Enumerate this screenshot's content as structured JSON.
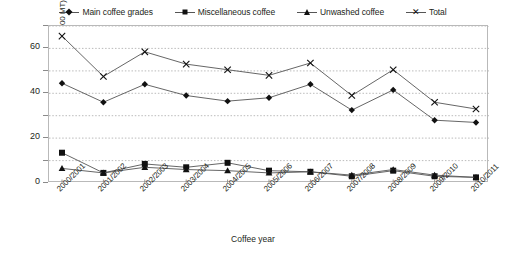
{
  "chart_data": {
    "type": "line",
    "title": "",
    "xlabel": "Coffee year",
    "ylabel": "Coffee auctioned (000 MT)",
    "categories": [
      "2000/2001",
      "2001/2002",
      "2002/2003",
      "2003/2004",
      "2004/2005",
      "2005/2006",
      "2006/2007",
      "2007/2008",
      "2008/2009",
      "2009/2010",
      "2010/2011"
    ],
    "ylim": [
      0,
      70
    ],
    "yticks": [
      0,
      20,
      40,
      60
    ],
    "ytick_labels": [
      "0",
      "20",
      "40",
      "60"
    ],
    "gridlines": [
      10,
      20,
      30,
      40,
      50,
      60,
      70
    ],
    "grid": true,
    "legend_position": "top",
    "series": [
      {
        "name": "Main coffee grades",
        "marker": "diamond",
        "values": [
          44.5,
          36.0,
          44.0,
          39.0,
          36.5,
          38.0,
          44.0,
          32.5,
          41.5,
          28.0,
          27.0
        ]
      },
      {
        "name": "Miscellaneous coffee",
        "marker": "square",
        "values": [
          13.5,
          4.5,
          8.5,
          7.0,
          9.0,
          5.5,
          5.0,
          3.0,
          5.5,
          3.0,
          2.5
        ]
      },
      {
        "name": "Unwashed coffee",
        "marker": "triangle",
        "values": [
          6.5,
          4.5,
          7.0,
          6.0,
          5.5,
          4.5,
          5.0,
          3.5,
          6.0,
          3.5,
          2.5
        ]
      },
      {
        "name": "Total",
        "marker": "cross",
        "values": [
          65.5,
          47.5,
          58.5,
          53.0,
          50.5,
          48.0,
          53.5,
          39.0,
          50.5,
          36.0,
          33.0
        ]
      }
    ]
  },
  "legend": {
    "items": [
      {
        "label": "Main coffee grades",
        "marker": "diamond-marker"
      },
      {
        "label": "Miscellaneous coffee",
        "marker": "square-marker"
      },
      {
        "label": "Unwashed coffee",
        "marker": "triangle-marker"
      },
      {
        "label": "Total",
        "marker": "cross-marker"
      }
    ]
  },
  "axes": {
    "y_title": "Coffee auctioned (000 MT)",
    "x_title": "Coffee year"
  },
  "colors": {
    "series_line": "#555555",
    "marker": "#111111",
    "grid": "#aaaaaa",
    "frame": "#b9b9b9",
    "text": "#231f20",
    "background": "#ffffff"
  }
}
